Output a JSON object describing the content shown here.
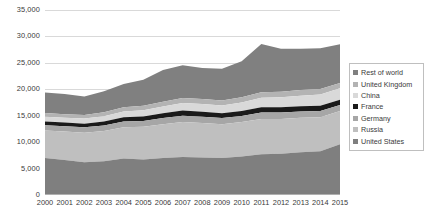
{
  "chart_data": {
    "type": "area",
    "stacked": true,
    "title": "",
    "xlabel": "",
    "ylabel": "",
    "grid": true,
    "legend_position": "right",
    "ylim": [
      0,
      35000
    ],
    "yticks": [
      "0",
      "5,000",
      "10,000",
      "15,000",
      "20,000",
      "25,000",
      "30,000",
      "35,000"
    ],
    "ytick_values": [
      0,
      5000,
      10000,
      15000,
      20000,
      25000,
      30000,
      35000
    ],
    "categories": [
      "2000",
      "2001",
      "2002",
      "2003",
      "2004",
      "2005",
      "2006",
      "2007",
      "2008",
      "2009",
      "2010",
      "2011",
      "2012",
      "2013",
      "2014",
      "2015"
    ],
    "series": [
      {
        "name": "United States",
        "color": "#7f7f7f",
        "values": [
          7000,
          6600,
          6200,
          6400,
          6900,
          6700,
          7000,
          7200,
          7100,
          7000,
          7300,
          7700,
          7800,
          8100,
          8300,
          9600
        ]
      },
      {
        "name": "Russia",
        "color": "#bfbfbf",
        "values": [
          5200,
          5400,
          5600,
          5700,
          5900,
          6200,
          6400,
          6600,
          6500,
          6400,
          6500,
          6700,
          6600,
          6500,
          6400,
          6300
        ]
      },
      {
        "name": "Germany",
        "color": "#a6a6a6",
        "values": [
          1000,
          1000,
          1000,
          1050,
          1100,
          1100,
          1150,
          1200,
          1200,
          1150,
          1150,
          1200,
          1200,
          1200,
          1200,
          1150
        ]
      },
      {
        "name": "France",
        "color": "#1a1a1a",
        "values": [
          700,
          700,
          700,
          750,
          800,
          850,
          900,
          1000,
          950,
          900,
          950,
          1000,
          1000,
          1000,
          1000,
          950
        ]
      },
      {
        "name": "China",
        "color": "#d9d9d9",
        "values": [
          900,
          900,
          950,
          1000,
          1100,
          1200,
          1300,
          1400,
          1450,
          1500,
          1600,
          1800,
          1900,
          2000,
          2100,
          2200
        ]
      },
      {
        "name": "United Kingdom",
        "color": "#b3b3b3",
        "values": [
          700,
          700,
          700,
          750,
          800,
          850,
          900,
          950,
          950,
          950,
          1000,
          1050,
          1050,
          1050,
          1050,
          1000
        ]
      },
      {
        "name": "Rest of world",
        "color": "#808080",
        "values": [
          3900,
          3800,
          3500,
          4000,
          4400,
          4900,
          6000,
          6200,
          5900,
          6000,
          6800,
          9100,
          8100,
          7800,
          7700,
          7300
        ]
      }
    ],
    "legend_order": [
      "Rest of world",
      "United Kingdom",
      "China",
      "France",
      "Germany",
      "Russia",
      "United States"
    ]
  },
  "legend": {
    "items": [
      {
        "label": "Rest of world",
        "color": "#808080"
      },
      {
        "label": "United Kingdom",
        "color": "#b3b3b3"
      },
      {
        "label": "China",
        "color": "#d9d9d9"
      },
      {
        "label": "France",
        "color": "#1a1a1a"
      },
      {
        "label": "Germany",
        "color": "#a6a6a6"
      },
      {
        "label": "Russia",
        "color": "#bfbfbf"
      },
      {
        "label": "United States",
        "color": "#7f7f7f"
      }
    ]
  },
  "colors": {
    "grid": "#d9d9d9",
    "axis": "#b0b0b0",
    "text": "#3a3a3a",
    "legend_border": "#bfbfbf",
    "background": "#ffffff"
  }
}
